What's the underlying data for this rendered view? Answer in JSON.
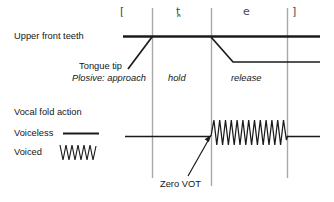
{
  "diagram": {
    "ipa_brackets": {
      "open": "[",
      "segment1": "t̪",
      "segment2": "e",
      "close": "]"
    },
    "labels": {
      "upper_front_teeth": "Upper front teeth",
      "tongue_tip": "Tongue tip",
      "plosive_approach": "Plosive: approach",
      "hold": "hold",
      "release": "release",
      "vocal_fold_action": "Vocal fold action",
      "voiceless": "Voiceless",
      "voiced": "Voiced",
      "zero_vot": "Zero VOT"
    },
    "colors": {
      "line": "#1b1b1b",
      "gridline": "#a8a8a8",
      "text": "#161616",
      "ipa_text": "#4a4a4a",
      "background": "#ffffff"
    },
    "gridlines_x": [
      152,
      211,
      287
    ],
    "phase_boundaries": {
      "approach_end": 152,
      "hold_end": 211,
      "release_end": 287
    },
    "waveform": {
      "cycles_main": 13,
      "cycles_legend": 6,
      "start_x": 211,
      "end_x": 287,
      "amplitude": 17
    }
  }
}
